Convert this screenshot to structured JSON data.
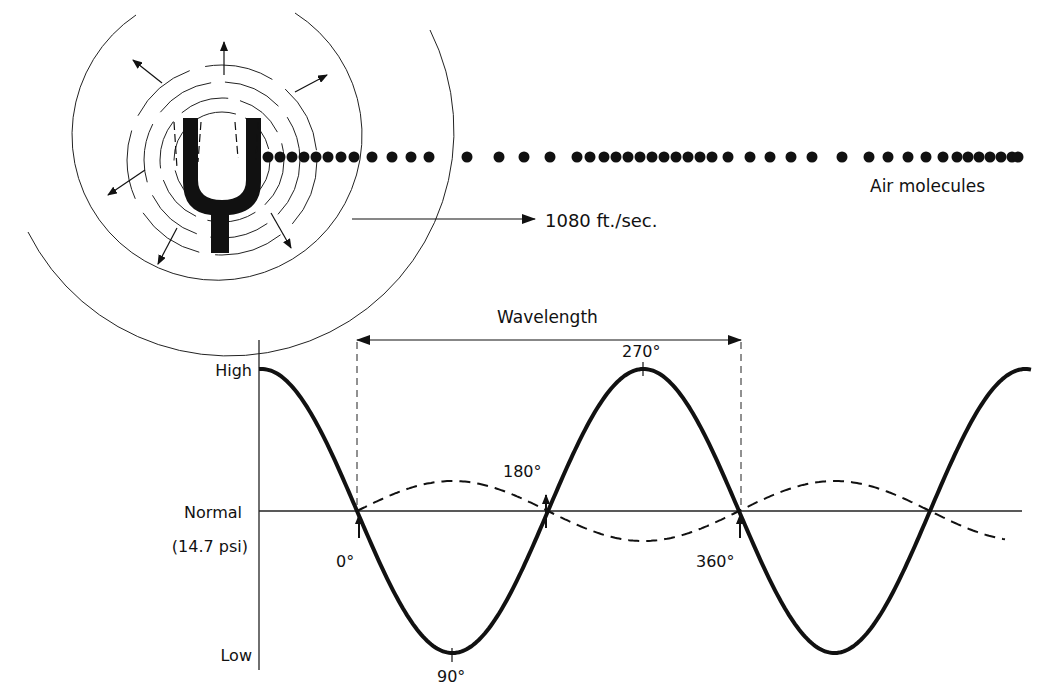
{
  "diagram": {
    "top": {
      "molecules_label": "Air molecules",
      "speed_label": "1080 ft./sec."
    },
    "graph": {
      "wavelength_label": "Wavelength",
      "y_labels": {
        "high": "High",
        "normal": "Normal",
        "normal_sub": "(14.7 psi)",
        "low": "Low"
      },
      "phase_labels": {
        "deg0": "0°",
        "deg90": "90°",
        "deg180": "180°",
        "deg270": "270°",
        "deg360": "360°"
      }
    }
  },
  "chart_data": {
    "type": "line",
    "xlabel": "Phase",
    "ylabel": "Pressure",
    "y_ticks": [
      "High",
      "Normal (14.7 psi)",
      "Low"
    ],
    "x_annotations": [
      "0°",
      "90°",
      "180°",
      "270°",
      "360°"
    ],
    "series": [
      {
        "name": "Pressure (solid)",
        "style": "solid",
        "x": [
          0,
          90,
          180,
          270,
          360
        ],
        "values": [
          0,
          -1,
          0,
          1,
          0
        ]
      },
      {
        "name": "Displacement (dashed)",
        "style": "dashed",
        "x": [
          0,
          90,
          180,
          270,
          360
        ],
        "values": [
          0,
          0.2,
          0,
          -0.2,
          0
        ]
      }
    ],
    "annotations": [
      "Wavelength spans 0° to 360°",
      "Air molecules",
      "1080 ft./sec."
    ]
  }
}
